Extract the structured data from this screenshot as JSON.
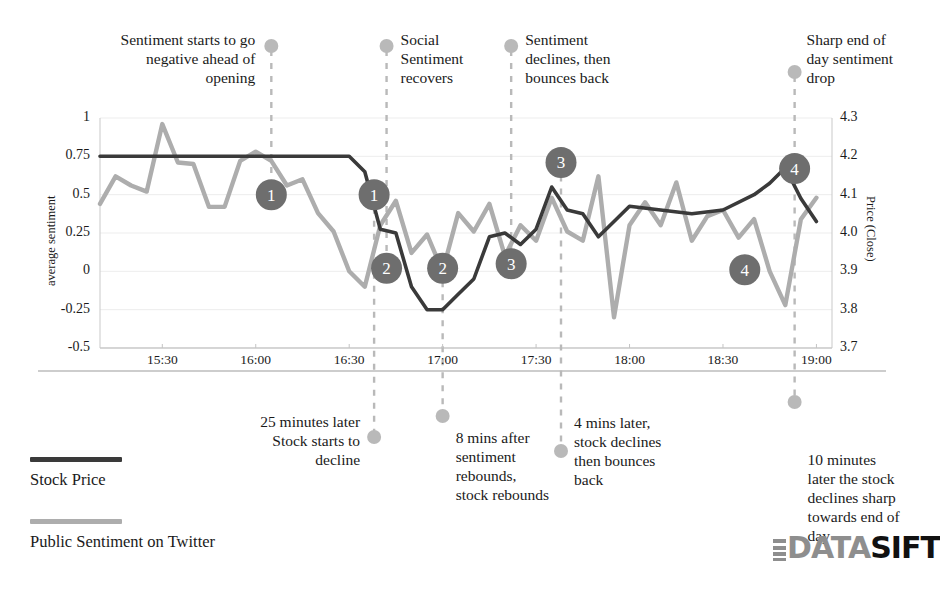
{
  "chart_data": {
    "type": "line",
    "title": "",
    "xlabel": "",
    "ylabel": "average sentiment",
    "y2label": "Price (Close)",
    "grid": true,
    "legend_position": "bottom-left",
    "x_ticks": [
      "15:30",
      "16:00",
      "16:30",
      "17:00",
      "17:30",
      "18:00",
      "18:30",
      "19:00"
    ],
    "y_ticks": [
      "1",
      "0.75",
      "0.5",
      "0.25",
      "0",
      "-0.25",
      "-0.5"
    ],
    "y2_ticks": [
      "4.3",
      "4.2",
      "4.1",
      "4.0",
      "3.9",
      "3.8",
      "3.7"
    ],
    "ylim": [
      -0.5,
      1
    ],
    "y2lim": [
      3.7,
      4.3
    ],
    "xlim": [
      "15:10",
      "19:05"
    ],
    "series": [
      {
        "name": "Stock Price",
        "axis": "right",
        "color": "#3a3a3a",
        "x": [
          "15:10",
          "15:20",
          "15:30",
          "15:40",
          "15:50",
          "16:00",
          "16:10",
          "16:20",
          "16:30",
          "16:35",
          "16:40",
          "16:45",
          "16:50",
          "16:55",
          "17:00",
          "17:05",
          "17:10",
          "17:15",
          "17:20",
          "17:25",
          "17:30",
          "17:35",
          "17:40",
          "17:45",
          "17:50",
          "17:55",
          "18:00",
          "18:10",
          "18:20",
          "18:30",
          "18:40",
          "18:45",
          "18:50",
          "18:55",
          "19:00"
        ],
        "values": [
          4.2,
          4.2,
          4.2,
          4.2,
          4.2,
          4.2,
          4.2,
          4.2,
          4.2,
          4.16,
          4.01,
          4.0,
          3.86,
          3.8,
          3.8,
          3.84,
          3.88,
          3.99,
          4.0,
          3.97,
          4.01,
          4.12,
          4.06,
          4.05,
          3.99,
          4.03,
          4.07,
          4.06,
          4.05,
          4.06,
          4.1,
          4.13,
          4.17,
          4.09,
          4.03
        ]
      },
      {
        "name": "Public Sentiment on Twitter",
        "axis": "left",
        "color": "#adadad",
        "x": [
          "15:10",
          "15:15",
          "15:20",
          "15:25",
          "15:30",
          "15:35",
          "15:40",
          "15:45",
          "15:50",
          "15:55",
          "16:00",
          "16:05",
          "16:10",
          "16:15",
          "16:20",
          "16:25",
          "16:30",
          "16:35",
          "16:40",
          "16:45",
          "16:50",
          "16:55",
          "17:00",
          "17:05",
          "17:10",
          "17:15",
          "17:20",
          "17:25",
          "17:30",
          "17:35",
          "17:40",
          "17:45",
          "17:50",
          "17:55",
          "18:00",
          "18:05",
          "18:10",
          "18:15",
          "18:20",
          "18:25",
          "18:30",
          "18:35",
          "18:40",
          "18:45",
          "18:50",
          "18:55",
          "19:00"
        ],
        "values": [
          0.44,
          0.62,
          0.56,
          0.52,
          0.96,
          0.71,
          0.7,
          0.42,
          0.42,
          0.72,
          0.78,
          0.72,
          0.56,
          0.6,
          0.38,
          0.26,
          0.0,
          -0.1,
          0.3,
          0.46,
          0.12,
          0.24,
          0.0,
          0.38,
          0.26,
          0.44,
          0.1,
          0.3,
          0.2,
          0.48,
          0.26,
          0.2,
          0.62,
          -0.3,
          0.3,
          0.45,
          0.3,
          0.58,
          0.2,
          0.36,
          0.4,
          0.22,
          0.34,
          0.0,
          -0.22,
          0.34,
          0.48
        ]
      }
    ],
    "markers": [
      {
        "label": "1",
        "series": "sentiment",
        "x": "16:05",
        "y": 0.5
      },
      {
        "label": "1",
        "series": "stock",
        "x": "16:38",
        "y": 0.5
      },
      {
        "label": "2",
        "series": "stock",
        "x": "16:42",
        "y": 0.02
      },
      {
        "label": "2",
        "series": "sentiment",
        "x": "17:00",
        "y": 0.02
      },
      {
        "label": "3",
        "series": "sentiment",
        "x": "17:22",
        "y": 0.05
      },
      {
        "label": "3",
        "series": "stock",
        "x": "17:38",
        "y": 0.71
      },
      {
        "label": "4",
        "series": "sentiment",
        "x": "18:37",
        "y": 0.01
      },
      {
        "label": "4",
        "series": "stock",
        "x": "18:53",
        "y": 0.67
      }
    ],
    "annotations_top": [
      {
        "text": "Sentiment starts to go\nnegative ahead of\nopening",
        "align": "right",
        "x": "16:05"
      },
      {
        "text": "Social\nSentiment\nrecovers",
        "align": "left",
        "x": "16:42"
      },
      {
        "text": "Sentiment\ndeclines, then\nbounces back",
        "align": "left",
        "x": "17:22"
      },
      {
        "text": "Sharp end of\nday sentiment\ndrop",
        "align": "left",
        "x": "18:53"
      }
    ],
    "annotations_bottom": [
      {
        "text": "25 minutes later\nStock starts to\ndecline",
        "align": "right",
        "x": "16:38"
      },
      {
        "text": "8 mins after\nsentiment\nrebounds,\nstock rebounds",
        "align": "left",
        "x": "17:00"
      },
      {
        "text": "4 mins later,\nstock declines\nthen bounces\nback",
        "align": "left",
        "x": "17:38"
      },
      {
        "text": "10 minutes\nlater the stock\ndeclines sharp\ntowards end of\nday",
        "align": "left",
        "x": "18:53"
      }
    ]
  },
  "legend": {
    "items": [
      {
        "label": "Stock Price",
        "color": "#3a3a3a"
      },
      {
        "label": "Public Sentiment on Twitter",
        "color": "#adadad"
      }
    ]
  },
  "logo": {
    "part1": "DATA",
    "part2": "SIFT"
  },
  "colors": {
    "stock_line": "#3a3a3a",
    "sentiment_line": "#adadad",
    "marker_fill": "#6e6e6e",
    "marker_text": "#ffffff",
    "annotation_line": "#b9b9b9",
    "grid": "#ededed",
    "axis": "#b5b5b5",
    "text": "#1a1a1a"
  }
}
